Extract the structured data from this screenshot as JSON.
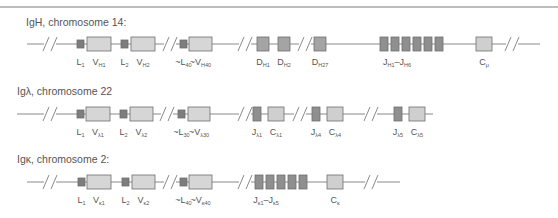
{
  "colors": {
    "line": "#8a8a8a",
    "leader_fill": "#7d7d7d",
    "v_fill": "#d6d6d6",
    "d_fill": "#a4a4a4",
    "j_fill": "#8f8f8f",
    "c_fill": "#cfcfcf",
    "stroke": "#6e6e6e",
    "top_rule": "#bdbdbd"
  },
  "rows": [
    {
      "title": "IgH, chromosome 14:",
      "line_y": 44,
      "line": [
        27,
        540
      ],
      "breaks": [
        50,
        170,
        245,
        305,
        512
      ],
      "segments": [
        {
          "kind": "L",
          "x": 77,
          "w": 7,
          "label": "L",
          "sub": "1"
        },
        {
          "kind": "V",
          "x": 87,
          "w": 24,
          "label": "V",
          "sub": "H1"
        },
        {
          "kind": "L",
          "x": 121,
          "w": 7,
          "label": "L",
          "sub": "2"
        },
        {
          "kind": "V",
          "x": 131,
          "w": 24,
          "label": "V",
          "sub": "H2"
        },
        {
          "kind": "L",
          "x": 180,
          "w": 7,
          "label": "~L",
          "sub": "40"
        },
        {
          "kind": "V",
          "x": 189,
          "w": 23,
          "label": "~V",
          "sub": "H40"
        },
        {
          "kind": "D",
          "x": 257,
          "w": 12,
          "label": "D",
          "sub": "H1"
        },
        {
          "kind": "D",
          "x": 278,
          "w": 12,
          "label": "D",
          "sub": "H2"
        },
        {
          "kind": "D",
          "x": 314,
          "w": 12,
          "label": "D",
          "sub": "H27"
        },
        {
          "kind": "J",
          "x": 380,
          "w": 8
        },
        {
          "kind": "J",
          "x": 391,
          "w": 8
        },
        {
          "kind": "J",
          "x": 402,
          "w": 8
        },
        {
          "kind": "J",
          "x": 413,
          "w": 8
        },
        {
          "kind": "J",
          "x": 424,
          "w": 8
        },
        {
          "kind": "J",
          "x": 435,
          "w": 8
        },
        {
          "kind": "C",
          "x": 476,
          "w": 16,
          "label": "C",
          "sub": "μ"
        }
      ],
      "group_labels": [
        {
          "x": 397,
          "text": "J",
          "sub": "H1",
          "text2": "–J",
          "sub2": "H6"
        }
      ]
    },
    {
      "title": "Igλ, chromosome 22",
      "line_y": 114,
      "line": [
        17,
        433
      ],
      "breaks": [
        50,
        167,
        245,
        300,
        371
      ],
      "segments": [
        {
          "kind": "L",
          "x": 77,
          "w": 7,
          "label": "L",
          "sub": "1"
        },
        {
          "kind": "V",
          "x": 86,
          "w": 24,
          "label": "V",
          "sub": "λ1"
        },
        {
          "kind": "L",
          "x": 120,
          "w": 7,
          "label": "L",
          "sub": "2"
        },
        {
          "kind": "V",
          "x": 130,
          "w": 23,
          "label": "V",
          "sub": "λ2"
        },
        {
          "kind": "L",
          "x": 178,
          "w": 7,
          "label": "~L",
          "sub": "30"
        },
        {
          "kind": "V",
          "x": 188,
          "w": 22,
          "label": "~V",
          "sub": "λ30"
        },
        {
          "kind": "J",
          "x": 253,
          "w": 8,
          "label": "J",
          "sub": "λ1"
        },
        {
          "kind": "C",
          "x": 268,
          "w": 16,
          "label": "C",
          "sub": "λ1"
        },
        {
          "kind": "J",
          "x": 312,
          "w": 8,
          "label": "J",
          "sub": "λ4"
        },
        {
          "kind": "C",
          "x": 327,
          "w": 16,
          "label": "C",
          "sub": "λ4"
        },
        {
          "kind": "J",
          "x": 394,
          "w": 8,
          "label": "J",
          "sub": "λ5"
        },
        {
          "kind": "C",
          "x": 409,
          "w": 16,
          "label": "C",
          "sub": "λ5"
        }
      ],
      "group_labels": []
    },
    {
      "title": "Igκ, chromosome 2:",
      "line_y": 182,
      "line": [
        27,
        400
      ],
      "breaks": [
        50,
        170,
        245,
        371
      ],
      "segments": [
        {
          "kind": "L",
          "x": 78,
          "w": 7,
          "label": "L",
          "sub": "1"
        },
        {
          "kind": "V",
          "x": 87,
          "w": 24,
          "label": "V",
          "sub": "κ1"
        },
        {
          "kind": "L",
          "x": 122,
          "w": 7,
          "label": "L",
          "sub": "2"
        },
        {
          "kind": "V",
          "x": 132,
          "w": 23,
          "label": "V",
          "sub": "κ2"
        },
        {
          "kind": "L",
          "x": 180,
          "w": 7,
          "label": "~L",
          "sub": "40"
        },
        {
          "kind": "V",
          "x": 189,
          "w": 23,
          "label": "~V",
          "sub": "κ40"
        },
        {
          "kind": "J",
          "x": 255,
          "w": 8
        },
        {
          "kind": "J",
          "x": 266,
          "w": 8
        },
        {
          "kind": "J",
          "x": 277,
          "w": 8
        },
        {
          "kind": "J",
          "x": 288,
          "w": 8
        },
        {
          "kind": "J",
          "x": 299,
          "w": 8
        },
        {
          "kind": "C",
          "x": 327,
          "w": 16,
          "label": "C",
          "sub": "κ"
        }
      ],
      "group_labels": [
        {
          "x": 266,
          "text": "J",
          "sub": "κ1",
          "text2": "–J",
          "sub2": "κ5"
        }
      ]
    }
  ]
}
